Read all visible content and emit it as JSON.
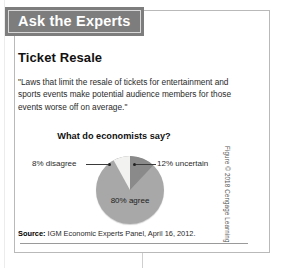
{
  "banner": {
    "title": "Ask the Experts",
    "bg_color": "#7d7d7d"
  },
  "headline": "Ticket Resale",
  "quote": "\"Laws that limit the resale of tickets for entertainment and sports events make potential audience members for those events worse off on average.\"",
  "chart_heading": "What do economists say?",
  "labels": {
    "disagree": "8% disagree",
    "uncertain": "12% uncertain",
    "agree": "80% agree"
  },
  "source": {
    "prefix": "Source:",
    "text": "IGM Economic Experts Panel, April 16, 2012."
  },
  "credit": "Figure © 2018 Cengage Learning",
  "chart_data": {
    "type": "pie",
    "title": "What do economists say?",
    "categories": [
      "80% agree",
      "12% uncertain",
      "8% disagree"
    ],
    "labels": [
      "agree",
      "uncertain",
      "disagree"
    ],
    "values": [
      80,
      12,
      8
    ],
    "units": "percent",
    "colors": [
      "#a8a8a8",
      "#8a8a8a",
      "#f2f2f0"
    ],
    "start_angle_deg": 0,
    "direction": "clockwise",
    "legend": "none",
    "annotations": [
      "8% disagree",
      "12% uncertain",
      "80% agree"
    ],
    "source": "IGM Economic Experts Panel, April 16, 2012."
  }
}
